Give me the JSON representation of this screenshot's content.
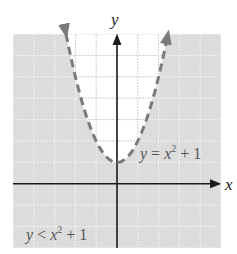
{
  "chart_data": {
    "type": "line",
    "title": "",
    "xlabel": "x",
    "ylabel": "y",
    "xlim": [
      -5,
      5
    ],
    "ylim": [
      -3,
      7
    ],
    "grid": true,
    "series": [
      {
        "name": "y = x^2 + 1",
        "style": "dashed",
        "boundary_of": "y < x^2 + 1",
        "x": [
          -2.45,
          -2,
          -1.5,
          -1,
          -0.5,
          0,
          0.5,
          1,
          1.5,
          2,
          2.45
        ],
        "y": [
          7,
          5,
          3.25,
          2,
          1.25,
          1,
          1.25,
          2,
          3.25,
          5,
          7
        ]
      }
    ],
    "shaded_region": "y < x^2 + 1 (outside/below parabola)",
    "annotations": [
      {
        "text": "y = x² + 1",
        "near": [
          2.2,
          1.5
        ]
      },
      {
        "text": "y < x² + 1",
        "near": [
          -3.5,
          -2.4
        ]
      }
    ]
  },
  "labels": {
    "x_axis": "x",
    "y_axis": "y",
    "curve_label_lhs": "y",
    "curve_label_eq": " = ",
    "curve_label_var": "x",
    "curve_label_exp": "2",
    "curve_label_rest": " + 1",
    "region_label_lhs": "y",
    "region_label_op": " < ",
    "region_label_var": "x",
    "region_label_exp": "2",
    "region_label_rest": " + 1"
  },
  "colors": {
    "shade": "#dcdcdc",
    "unshaded": "#ffffff",
    "grid_on_shade": "#f2f2f2",
    "grid_on_white": "#cfcfcf",
    "curve": "#7a7a7a",
    "axis": "#1a1a1a"
  }
}
